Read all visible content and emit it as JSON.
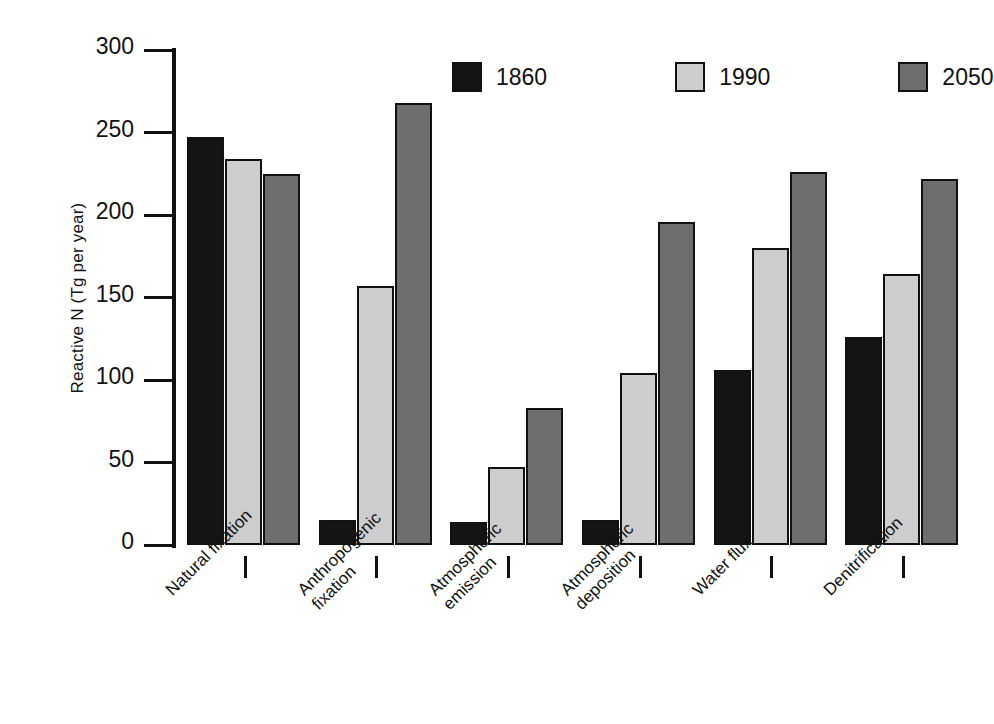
{
  "chart_data": {
    "type": "bar",
    "title": "",
    "subtitle": "",
    "xlabel": "",
    "ylabel": "Reactive N (Tg per year)",
    "ylim": [
      0,
      300
    ],
    "yticks": [
      0,
      50,
      100,
      150,
      200,
      250,
      300
    ],
    "ytick_labels": [
      "0",
      "50",
      "100",
      "150",
      "200",
      "250",
      "300"
    ],
    "grid": false,
    "legend_position": "top-center",
    "categories": [
      "Natural fixation",
      "Anthropogenic\nfixation",
      "Atmospheric\nemission",
      "Atmospheric\ndeposition",
      "Water flux",
      "Denitrification"
    ],
    "series": [
      {
        "name": "1860",
        "color": "#141414",
        "values": [
          247,
          15,
          14,
          15,
          106,
          126
        ]
      },
      {
        "name": "1990",
        "color": "#cdcdcd",
        "values": [
          234,
          157,
          47,
          104,
          180,
          164
        ]
      },
      {
        "name": "2050",
        "color": "#6e6e6e",
        "values": [
          225,
          268,
          83,
          196,
          226,
          222
        ]
      }
    ]
  },
  "colors": {
    "axis": "#111111",
    "background": "#ffffff",
    "series_1860": "#141414",
    "series_1990": "#cdcdcd",
    "series_2050": "#6e6e6e"
  }
}
